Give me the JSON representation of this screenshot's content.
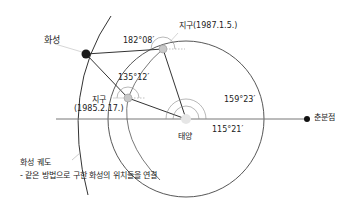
{
  "diagram": {
    "title": "",
    "labels": {
      "mars": "화성",
      "earth_1987": "지구(1987.1.5.)",
      "earth_1985_name": "지구",
      "earth_1985_date": "(1985.2.17.)",
      "sun": "태양",
      "vernal_equinox": "춘분점",
      "mars_orbit": "화성 궤도",
      "mars_orbit_note": "- 같은 방법으로 구한 화성의 위치들을 연결"
    },
    "angles": {
      "earth_1987_to_mars": "182°08′",
      "earth_1985_to_mars": "135°12′",
      "sun_to_earth_1987": "159°23′",
      "sun_to_earth_1985": "115°21′"
    },
    "colors": {
      "line": "#333333",
      "mars": "#1a1a1a",
      "earth": "#c8c8c8",
      "sun": "#e6e6e6",
      "guide": "#aaaaaa"
    }
  }
}
